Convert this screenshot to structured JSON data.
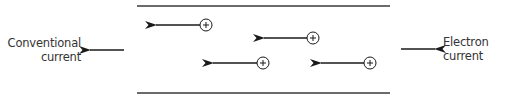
{
  "diagram": {
    "title": "",
    "labels": {
      "conventional": {
        "line1": "Conventional",
        "line2": "current",
        "direction": "left"
      },
      "electron": {
        "line1": "Electron",
        "line2": "current",
        "direction": "right"
      }
    },
    "wire": {
      "top_y": 6,
      "bottom_y": 93,
      "x_start": 137,
      "x_end": 390,
      "color": "#3a3a3a"
    },
    "charges": [
      {
        "symbol": "+",
        "cx": 206,
        "cy": 25,
        "arrow_tip_x": 155,
        "direction": "left"
      },
      {
        "symbol": "+",
        "cx": 313,
        "cy": 38,
        "arrow_tip_x": 263,
        "direction": "left"
      },
      {
        "symbol": "+",
        "cx": 263,
        "cy": 63,
        "arrow_tip_x": 212,
        "direction": "left"
      },
      {
        "symbol": "+",
        "cx": 370,
        "cy": 63,
        "arrow_tip_x": 320,
        "direction": "left"
      }
    ],
    "colors": {
      "stroke": "#1a1a1a",
      "text": "#333333",
      "background": "#ffffff"
    }
  }
}
